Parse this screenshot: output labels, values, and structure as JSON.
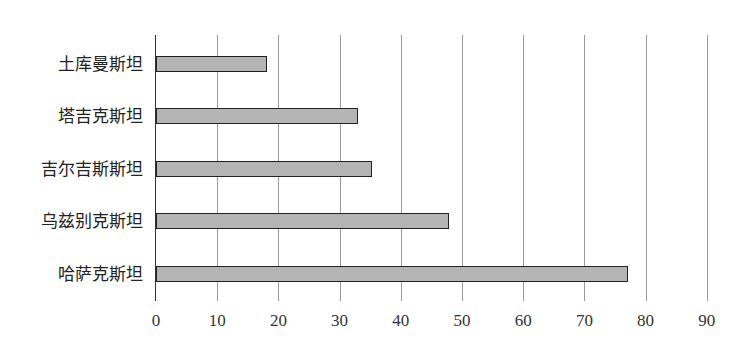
{
  "chart_data": {
    "type": "bar",
    "orientation": "horizontal",
    "title": "",
    "xlabel": "",
    "ylabel": "",
    "categories": [
      "土库曼斯坦",
      "塔吉克斯坦",
      "吉尔吉斯斯坦",
      "乌兹别克斯坦",
      "哈萨克斯坦"
    ],
    "values": [
      18.1,
      33.0,
      35.3,
      47.9,
      77.1
    ],
    "xlim": [
      0,
      90
    ],
    "xticks": [
      "0",
      "10",
      "20",
      "30",
      "40",
      "50",
      "60",
      "70",
      "80",
      "90"
    ],
    "grid": "vertical",
    "legend": null,
    "bar_color": "#b4b4b4",
    "bar_edge_color": "#222222"
  }
}
